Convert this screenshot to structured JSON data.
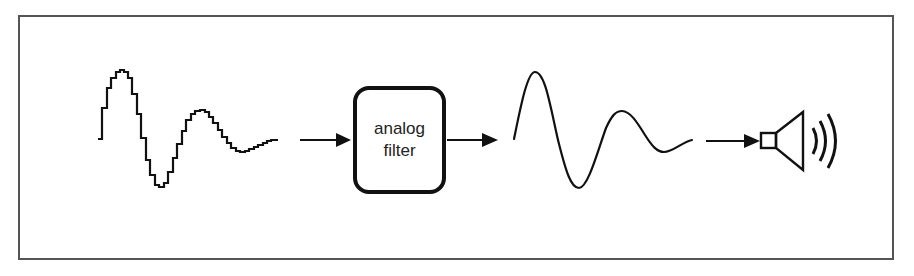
{
  "diagram": {
    "type": "signal-flow",
    "nodes": [
      {
        "id": "staircase-signal",
        "label": "",
        "kind": "stepped-waveform"
      },
      {
        "id": "analog-filter",
        "label_line1": "analog",
        "label_line2": "filter",
        "kind": "rounded-box"
      },
      {
        "id": "smooth-signal",
        "label": "",
        "kind": "smooth-waveform"
      },
      {
        "id": "speaker",
        "label": "",
        "kind": "speaker-icon"
      }
    ],
    "edges": [
      {
        "from": "staircase-signal",
        "to": "analog-filter"
      },
      {
        "from": "analog-filter",
        "to": "smooth-signal"
      },
      {
        "from": "smooth-signal",
        "to": "speaker"
      }
    ],
    "colors": {
      "stroke": "#111111",
      "frame": "#555555",
      "text": "#222222",
      "background": "#ffffff"
    }
  },
  "filter": {
    "line1": "analog",
    "line2": "filter"
  }
}
